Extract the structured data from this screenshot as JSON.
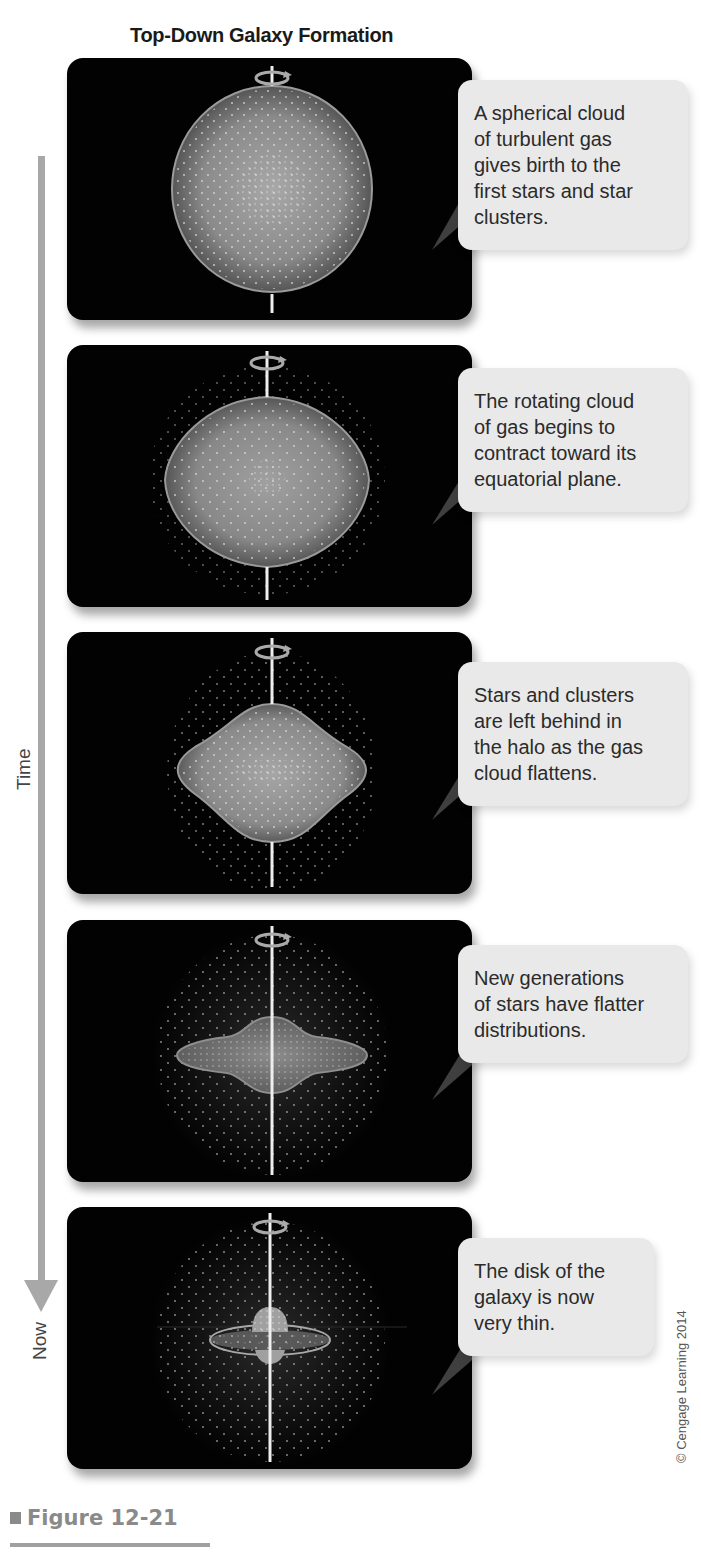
{
  "title": "Top-Down Galaxy Formation",
  "timeline": {
    "axis_label": "Time",
    "end_label": "Now",
    "arrow_color": "#a8a8a8"
  },
  "panels": [
    {
      "stage": "spherical-cloud",
      "caption": "A spherical cloud of turbulent gas gives birth to the first stars and star clusters.",
      "caption_lines": [
        "A spherical cloud",
        "of turbulent gas",
        "gives birth to the",
        "first stars and star",
        "clusters."
      ]
    },
    {
      "stage": "contracting-cloud",
      "caption": "The rotating cloud of gas begins to contract toward its equatorial plane.",
      "caption_lines": [
        "The rotating cloud",
        "of gas begins to",
        "contract toward its",
        "equatorial plane."
      ]
    },
    {
      "stage": "flattening-cloud",
      "caption": "Stars and clusters are left behind in the halo as the gas cloud flattens.",
      "caption_lines": [
        "Stars and clusters",
        "are left behind in",
        "the halo as the gas",
        "cloud flattens."
      ]
    },
    {
      "stage": "flatter-generations",
      "caption": "New generations of stars have flatter distributions.",
      "caption_lines": [
        "New generations",
        "of stars have flatter",
        "distributions."
      ]
    },
    {
      "stage": "thin-disk",
      "caption": "The disk of the galaxy is now very thin.",
      "caption_lines": [
        "The disk of the",
        "galaxy is now",
        "very thin."
      ]
    }
  ],
  "colors": {
    "panel_bg": "#020202",
    "cloud_fill": "#8c8c8c",
    "cloud_edge": "#a0a0a0",
    "star": "#d8d8d8",
    "callout_bg": "#e9e9e9"
  },
  "copyright": "© Cengage Learning 2014",
  "figure": {
    "label": "Figure 12-21"
  }
}
